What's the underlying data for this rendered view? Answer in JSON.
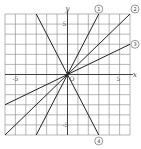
{
  "chart_data": {
    "type": "line",
    "title": "",
    "xlabel": "x",
    "ylabel": "y",
    "origin_label": "O",
    "xlim": [
      -6,
      6
    ],
    "ylim": [
      -6,
      6
    ],
    "grid": true,
    "tick_labels": {
      "x": [
        {
          "value": -5,
          "label": "-5"
        },
        {
          "value": 5,
          "label": "5"
        }
      ],
      "y": [
        {
          "value": 5,
          "label": "5"
        },
        {
          "value": -5,
          "label": "-5"
        }
      ]
    },
    "series": [
      {
        "name": "①",
        "slope": 2,
        "intercept": 0,
        "label_at": [
          3,
          6
        ]
      },
      {
        "name": "②",
        "slope": 1,
        "intercept": 0,
        "label_at": [
          6,
          6
        ]
      },
      {
        "name": "③",
        "slope": 0.5,
        "intercept": 0,
        "label_at": [
          6,
          3
        ]
      },
      {
        "name": "④",
        "slope": -2,
        "intercept": 0,
        "label_at": [
          3,
          -6
        ]
      }
    ]
  }
}
